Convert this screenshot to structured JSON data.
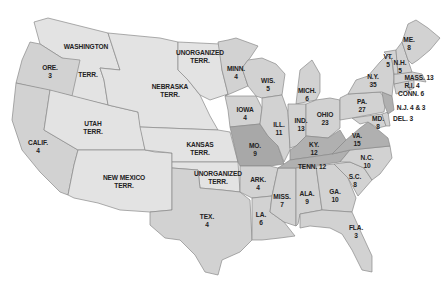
{
  "map": {
    "title": "Electoral votes by state",
    "regions": [
      {
        "id": "washington",
        "name": "WASHINGTON",
        "sub": "",
        "votes": ""
      },
      {
        "id": "washington-terr",
        "name": "TERR.",
        "sub": "",
        "votes": ""
      },
      {
        "id": "oregon",
        "name": "ORE.",
        "votes": "3"
      },
      {
        "id": "california",
        "name": "CALIF.",
        "votes": "4"
      },
      {
        "id": "utah",
        "name": "UTAH",
        "sub": "TERR."
      },
      {
        "id": "new-mexico",
        "name": "NEW MEXICO",
        "sub": "TERR."
      },
      {
        "id": "nebraska",
        "name": "NEBRASKA",
        "sub": "TERR."
      },
      {
        "id": "unorganized-north",
        "name": "UNORGANIZED",
        "sub": "TERR."
      },
      {
        "id": "kansas",
        "name": "KANSAS",
        "sub": "TERR."
      },
      {
        "id": "unorganized-south",
        "name": "UNORGANIZED",
        "sub": "TERR."
      },
      {
        "id": "texas",
        "name": "TEX.",
        "votes": "4"
      },
      {
        "id": "minnesota",
        "name": "MINN.",
        "votes": "4"
      },
      {
        "id": "iowa",
        "name": "IOWA",
        "votes": "4"
      },
      {
        "id": "missouri",
        "name": "MO.",
        "votes": "9"
      },
      {
        "id": "arkansas",
        "name": "ARK.",
        "votes": "4"
      },
      {
        "id": "louisiana",
        "name": "LA.",
        "votes": "6"
      },
      {
        "id": "wisconsin",
        "name": "WIS.",
        "votes": "5"
      },
      {
        "id": "illinois",
        "name": "ILL.",
        "votes": "11"
      },
      {
        "id": "mississippi",
        "name": "MISS.",
        "votes": "7"
      },
      {
        "id": "michigan",
        "name": "MICH.",
        "votes": "6"
      },
      {
        "id": "indiana",
        "name": "IND.",
        "votes": "13"
      },
      {
        "id": "ohio",
        "name": "OHIO",
        "votes": "23"
      },
      {
        "id": "kentucky",
        "name": "KY.",
        "votes": "12"
      },
      {
        "id": "tennessee",
        "name": "TENN.",
        "votes": "12"
      },
      {
        "id": "alabama",
        "name": "ALA.",
        "votes": "9"
      },
      {
        "id": "georgia",
        "name": "GA.",
        "votes": "10"
      },
      {
        "id": "florida",
        "name": "FLA.",
        "votes": "3"
      },
      {
        "id": "south-carolina",
        "name": "S.C.",
        "votes": "8"
      },
      {
        "id": "north-carolina",
        "name": "N.C.",
        "votes": "10"
      },
      {
        "id": "virginia",
        "name": "VA.",
        "votes": "15"
      },
      {
        "id": "maryland",
        "name": "MD.",
        "votes": "8"
      },
      {
        "id": "delaware",
        "name": "DEL.",
        "votes": "3"
      },
      {
        "id": "pennsylvania",
        "name": "PA.",
        "votes": "27"
      },
      {
        "id": "new-jersey",
        "name": "N.J.",
        "votes": "4 & 3"
      },
      {
        "id": "new-york",
        "name": "N.Y.",
        "votes": "35"
      },
      {
        "id": "connecticut",
        "name": "CONN.",
        "votes": "6"
      },
      {
        "id": "rhode-island",
        "name": "R.I.",
        "votes": "4"
      },
      {
        "id": "massachusetts",
        "name": "MASS.",
        "votes": "13"
      },
      {
        "id": "vermont",
        "name": "VT.",
        "votes": "5"
      },
      {
        "id": "new-hampshire",
        "name": "N.H.",
        "votes": "5"
      },
      {
        "id": "maine",
        "name": "ME.",
        "votes": "8"
      }
    ],
    "labels": {
      "washington": "WASHINGTON",
      "washington_terr": "TERR.",
      "ore": "ORE.",
      "ore_v": "3",
      "calif": "CALIF.",
      "calif_v": "4",
      "utah": "UTAH",
      "utah_t": "TERR.",
      "nm": "NEW MEXICO",
      "nm_t": "TERR.",
      "neb": "NEBRASKA",
      "neb_t": "TERR.",
      "unorg_n": "UNORGANIZED",
      "unorg_n_t": "TERR.",
      "kansas": "KANSAS",
      "kansas_t": "TERR.",
      "unorg_s": "UNORGANIZED",
      "unorg_s_t": "TERR.",
      "tex": "TEX.",
      "tex_v": "4",
      "minn": "MINN.",
      "minn_v": "4",
      "iowa": "IOWA",
      "iowa_v": "4",
      "mo": "MO.",
      "mo_v": "9",
      "ark": "ARK.",
      "ark_v": "4",
      "la": "LA.",
      "la_v": "6",
      "wis": "WIS.",
      "wis_v": "5",
      "ill": "ILL.",
      "ill_v": "11",
      "miss": "MISS.",
      "miss_v": "7",
      "mich": "MICH.",
      "mich_v": "6",
      "ind": "IND.",
      "ind_v": "13",
      "ohio": "OHIO",
      "ohio_v": "23",
      "ky": "KY.",
      "ky_v": "12",
      "tenn": "TENN. 12",
      "ala": "ALA.",
      "ala_v": "9",
      "ga": "GA.",
      "ga_v": "10",
      "fla": "FLA.",
      "fla_v": "3",
      "sc": "S.C.",
      "sc_v": "8",
      "nc": "N.C.",
      "nc_v": "10",
      "va": "VA.",
      "va_v": "15",
      "md": "MD.",
      "md_v": "8",
      "del": "DEL. 3",
      "pa": "PA.",
      "pa_v": "27",
      "nj": "N.J. 4 & 3",
      "ny": "N.Y.",
      "ny_v": "35",
      "conn": "CONN. 6",
      "ri": "R.I. 4",
      "mass": "MASS. 13",
      "vt": "VT.",
      "vt_v": "5",
      "nh": "N.H.",
      "nh_v": "5",
      "me": "ME.",
      "me_v": "8"
    },
    "colors": {
      "territory": "#e3e3e3",
      "state": "#d2d2d2",
      "border_state": "#b0b0b0",
      "border": "#8a8a8a"
    }
  }
}
